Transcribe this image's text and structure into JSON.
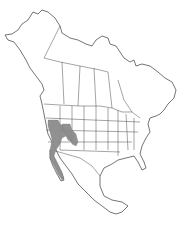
{
  "map": {
    "title": "North America species range map",
    "region": "North America",
    "range_color": "#8c8c8c",
    "outline_color": "#3a3a3a",
    "background_color": "#ffffff",
    "range_areas": [
      "Nevada",
      "Eastern California",
      "Western Utah",
      "Western Arizona",
      "Southern California",
      "Baja California"
    ]
  }
}
